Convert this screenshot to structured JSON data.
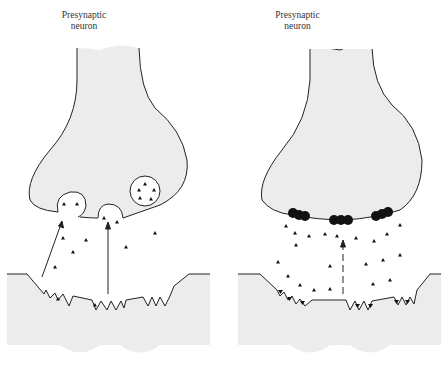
{
  "figure": {
    "panels": [
      {
        "id": "left",
        "label_line1": "Presynaptic",
        "label_line2": "neuron",
        "description": "Vesicles fusing with membrane releasing transmitter; arrows show transmitter release to postsynaptic receptors"
      },
      {
        "id": "right",
        "label_line1": "Presynaptic",
        "label_line2": "neuron",
        "description": "Clusters of dark particles at membrane; dashed arrow indicating transmitter diffusion to receptors"
      }
    ],
    "colors": {
      "cell_fill": "#ececec",
      "outline": "#222222",
      "background": "#ffffff",
      "particle": "#111111"
    }
  }
}
